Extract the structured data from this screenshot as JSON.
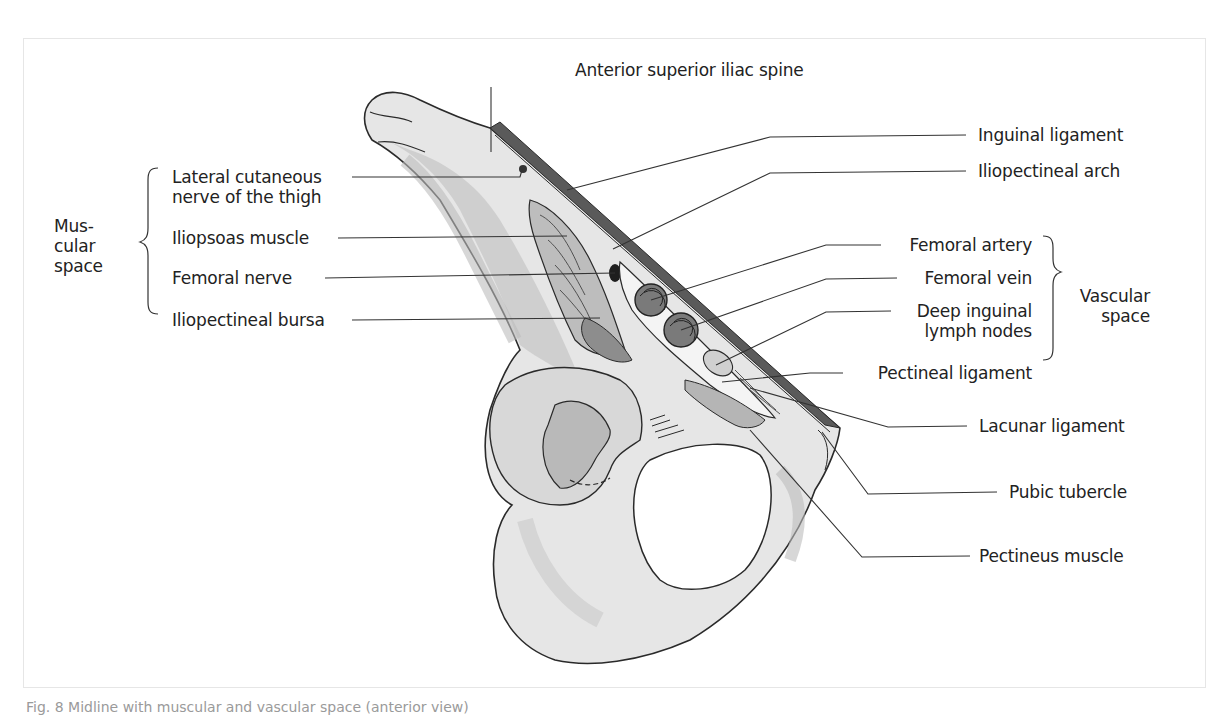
{
  "figure": {
    "title_top": "Anterior superior iliac spine",
    "caption": "Fig. 8 Midline with muscular and vascular space (anterior view)"
  },
  "left_group": {
    "group_label_lines": [
      "Mus-",
      "cular",
      "space"
    ],
    "labels": [
      {
        "id": "lateral-cutaneous-nerve",
        "lines": [
          "Lateral cutaneous",
          "nerve of the thigh"
        ]
      },
      {
        "id": "iliopsoas-muscle",
        "lines": [
          "Iliopsoas muscle"
        ]
      },
      {
        "id": "femoral-nerve",
        "lines": [
          "Femoral nerve"
        ]
      },
      {
        "id": "iliopectineal-bursa",
        "lines": [
          "Iliopectineal bursa"
        ]
      }
    ]
  },
  "right_group": {
    "group_label_lines": [
      "Vascular",
      "space"
    ],
    "labels": [
      {
        "id": "femoral-artery",
        "lines": [
          "Femoral artery"
        ]
      },
      {
        "id": "femoral-vein",
        "lines": [
          "Femoral vein"
        ]
      },
      {
        "id": "deep-inguinal-lymph-nodes",
        "lines": [
          "Deep inguinal",
          "lymph nodes"
        ]
      },
      {
        "id": "pectineal-ligament",
        "lines": [
          "Pectineal ligament"
        ]
      }
    ]
  },
  "right_labels": [
    {
      "id": "inguinal-ligament",
      "text": "Inguinal ligament"
    },
    {
      "id": "iliopectineal-arch",
      "text": "Iliopectineal arch"
    },
    {
      "id": "lacunar-ligament",
      "text": "Lacunar ligament"
    },
    {
      "id": "pubic-tubercle",
      "text": "Pubic tubercle"
    },
    {
      "id": "pectineus-muscle",
      "text": "Pectineus muscle"
    }
  ],
  "colors": {
    "bone_light": "#e8e8e8",
    "bone_mid": "#c9c9c9",
    "bone_dark": "#a9a9a9",
    "ligament": "#555555",
    "vessel": "#7a7a7a",
    "outline": "#2a2a2a"
  }
}
